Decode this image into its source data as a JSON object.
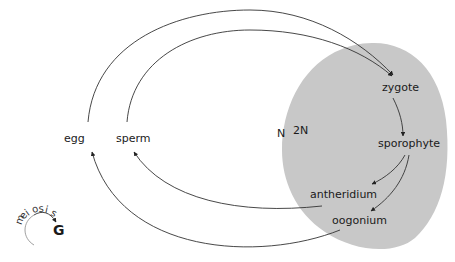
{
  "diagram": {
    "colors": {
      "diploid_region": "#c8c8c8",
      "arrow": "#333333",
      "text": "#1a1a1a",
      "background": "#ffffff"
    },
    "regions": {
      "haploid_label": "N",
      "diploid_label": "2N"
    },
    "nodes": {
      "zygote": "zygote",
      "sporophyte": "sporophyte",
      "antheridium": "antheridium",
      "oogonium": "oogonium",
      "egg": "egg",
      "sperm": "sperm"
    },
    "legend": {
      "meiosis_label": "meiosis",
      "meiosis_symbol": "G"
    },
    "edges": [
      {
        "from": "egg",
        "to": "zygote"
      },
      {
        "from": "sperm",
        "to": "zygote"
      },
      {
        "from": "zygote",
        "to": "sporophyte"
      },
      {
        "from": "sporophyte",
        "to": "antheridium"
      },
      {
        "from": "sporophyte",
        "to": "oogonium"
      },
      {
        "from": "antheridium",
        "to": "sperm",
        "label": "G"
      },
      {
        "from": "oogonium",
        "to": "egg",
        "label": "G"
      }
    ]
  }
}
